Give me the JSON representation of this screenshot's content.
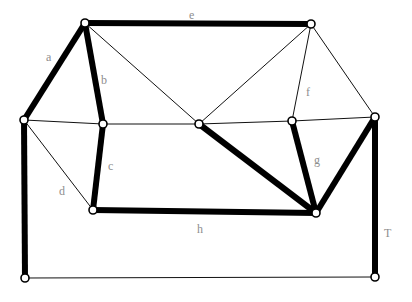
{
  "diagram": {
    "colors": {
      "background": "#ffffff",
      "edge": "#000000",
      "thin_edge": "#111111",
      "vertex_fill": "#ffffff",
      "vertex_stroke": "#000000",
      "label": "#8e8e8e"
    },
    "style": {
      "thick_edge_width": 6,
      "thin_edge_width": 1,
      "vertex_radius": 4
    },
    "vertices": [
      {
        "id": "v_topleft_apex",
        "name": "top-left-apex-vertex",
        "x": 85,
        "y": 23
      },
      {
        "id": "v_topright_apex",
        "name": "top-right-apex-vertex",
        "x": 311,
        "y": 24
      },
      {
        "id": "v_left_mid",
        "name": "left-middle-vertex",
        "x": 24,
        "y": 120
      },
      {
        "id": "v_inner_left",
        "name": "inner-left-vertex",
        "x": 103,
        "y": 124
      },
      {
        "id": "v_center",
        "name": "center-vertex",
        "x": 199,
        "y": 124
      },
      {
        "id": "v_inner_right",
        "name": "inner-right-vertex",
        "x": 292,
        "y": 121
      },
      {
        "id": "v_right_mid",
        "name": "right-middle-vertex",
        "x": 375,
        "y": 117
      },
      {
        "id": "v_lower_left",
        "name": "lower-left-vertex",
        "x": 93,
        "y": 210
      },
      {
        "id": "v_lower_right",
        "name": "lower-right-vertex",
        "x": 316,
        "y": 213
      },
      {
        "id": "v_bottom_left",
        "name": "bottom-left-corner-vertex",
        "x": 25,
        "y": 278
      },
      {
        "id": "v_bottom_right",
        "name": "bottom-right-corner-vertex",
        "x": 375,
        "y": 277
      }
    ],
    "edges": [
      {
        "id": "e_a",
        "name": "edge-a",
        "from": "v_left_mid",
        "to": "v_topleft_apex",
        "weight": "thick",
        "label": "a"
      },
      {
        "id": "e_b",
        "name": "edge-b",
        "from": "v_topleft_apex",
        "to": "v_inner_left",
        "weight": "thick",
        "label": "b"
      },
      {
        "id": "e_c",
        "name": "edge-c",
        "from": "v_inner_left",
        "to": "v_lower_left",
        "weight": "thick",
        "label": "c"
      },
      {
        "id": "e_d",
        "name": "edge-d",
        "from": "v_left_mid",
        "to": "v_lower_left",
        "weight": "thin",
        "label": "d"
      },
      {
        "id": "e_e",
        "name": "edge-e",
        "from": "v_topleft_apex",
        "to": "v_topright_apex",
        "weight": "thick",
        "label": "e"
      },
      {
        "id": "e_f",
        "name": "edge-f",
        "from": "v_topright_apex",
        "to": "v_inner_right",
        "weight": "thin",
        "label": "f"
      },
      {
        "id": "e_g",
        "name": "edge-g",
        "from": "v_inner_right",
        "to": "v_lower_right",
        "weight": "thick",
        "label": "g"
      },
      {
        "id": "e_h",
        "name": "edge-h",
        "from": "v_lower_left",
        "to": "v_lower_right",
        "weight": "thick",
        "label": "h"
      },
      {
        "id": "e_T",
        "name": "edge-T",
        "from": "v_right_mid",
        "to": "v_bottom_right",
        "weight": "thick",
        "label": "T"
      },
      {
        "id": "e_leftspine",
        "name": "edge-left-spine",
        "from": "v_left_mid",
        "to": "v_bottom_left",
        "weight": "thick",
        "label": ""
      },
      {
        "id": "e_bottom",
        "name": "edge-bottom",
        "from": "v_bottom_left",
        "to": "v_bottom_right",
        "weight": "thin",
        "label": ""
      },
      {
        "id": "e_diag_center",
        "name": "edge-center-to-lower-right",
        "from": "v_center",
        "to": "v_lower_right",
        "weight": "thick",
        "label": ""
      },
      {
        "id": "e_right_diag",
        "name": "edge-right-mid-to-lower-right",
        "from": "v_right_mid",
        "to": "v_lower_right",
        "weight": "thick",
        "label": ""
      },
      {
        "id": "e_mid_left",
        "name": "edge-left-mid-to-inner-left",
        "from": "v_left_mid",
        "to": "v_inner_left",
        "weight": "thin",
        "label": ""
      },
      {
        "id": "e_mid_center",
        "name": "edge-inner-left-to-center",
        "from": "v_inner_left",
        "to": "v_center",
        "weight": "thin",
        "label": ""
      },
      {
        "id": "e_mid_right",
        "name": "edge-center-to-inner-right",
        "from": "v_center",
        "to": "v_inner_right",
        "weight": "thin",
        "label": ""
      },
      {
        "id": "e_mid_far_right",
        "name": "edge-inner-right-to-right-mid",
        "from": "v_inner_right",
        "to": "v_right_mid",
        "weight": "thin",
        "label": ""
      },
      {
        "id": "e_apex_center",
        "name": "edge-top-left-apex-to-center",
        "from": "v_topleft_apex",
        "to": "v_center",
        "weight": "thin",
        "label": ""
      },
      {
        "id": "e_apex_right_center",
        "name": "edge-top-right-apex-to-center",
        "from": "v_topright_apex",
        "to": "v_center",
        "weight": "thin",
        "label": ""
      },
      {
        "id": "e_apex_right_far",
        "name": "edge-top-right-apex-to-right-mid",
        "from": "v_topright_apex",
        "to": "v_right_mid",
        "weight": "thin",
        "label": ""
      }
    ],
    "labels": [
      {
        "id": "lbl_a",
        "name": "label-a",
        "text": "a",
        "x": 46,
        "y": 51
      },
      {
        "id": "lbl_b",
        "name": "label-b",
        "text": "b",
        "x": 101,
        "y": 74
      },
      {
        "id": "lbl_c",
        "name": "label-c",
        "text": "c",
        "x": 108,
        "y": 160
      },
      {
        "id": "lbl_d",
        "name": "label-d",
        "text": "d",
        "x": 59,
        "y": 185
      },
      {
        "id": "lbl_e",
        "name": "label-e",
        "text": "e",
        "x": 189,
        "y": 9
      },
      {
        "id": "lbl_f",
        "name": "label-f",
        "text": "f",
        "x": 306,
        "y": 86
      },
      {
        "id": "lbl_g",
        "name": "label-g",
        "text": "g",
        "x": 314,
        "y": 154
      },
      {
        "id": "lbl_h",
        "name": "label-h",
        "text": "h",
        "x": 197,
        "y": 223
      },
      {
        "id": "lbl_T",
        "name": "label-T",
        "text": "T",
        "x": 384,
        "y": 227
      }
    ]
  }
}
